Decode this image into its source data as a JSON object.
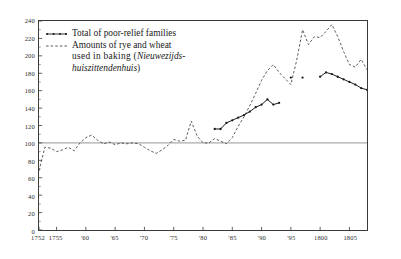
{
  "chart_data": {
    "type": "line",
    "title": "",
    "xlabel": "",
    "ylabel": "",
    "xlim": [
      1752,
      1808
    ],
    "ylim": [
      0,
      240
    ],
    "grid": false,
    "reference_line": 100,
    "legend_position": "top-left",
    "y_ticks": [
      0,
      20,
      40,
      60,
      80,
      100,
      120,
      140,
      160,
      180,
      200,
      220,
      240
    ],
    "y_tick_labels": [
      "0",
      "20",
      "40",
      "60",
      "80",
      "100",
      "120",
      "140",
      "160",
      "180",
      "200",
      "220",
      "240"
    ],
    "x_ticks": [
      1752,
      1755,
      1760,
      1765,
      1770,
      1775,
      1780,
      1785,
      1790,
      1795,
      1800,
      1805
    ],
    "x_tick_labels": [
      "1752",
      "1755",
      "'60",
      "'65",
      "'70",
      "'75",
      "'80",
      "'85",
      "'90",
      "'95",
      "1800",
      "1805"
    ],
    "series": [
      {
        "name": "Total of poor-relief families",
        "style": "solid-with-markers",
        "color": "#1a1a1a",
        "x": [
          1782,
          1783,
          1784,
          1785,
          1786,
          1787,
          1788,
          1789,
          1790,
          1791,
          1792,
          1793,
          1795,
          1797,
          1800,
          1801,
          1802,
          1803,
          1804,
          1805,
          1806,
          1807,
          1808
        ],
        "y": [
          116,
          116,
          123,
          126,
          129,
          132,
          136,
          141,
          144,
          150,
          144,
          146,
          175,
          175,
          176,
          181,
          179,
          176,
          173,
          170,
          167,
          163,
          161
        ],
        "segments": [
          {
            "x": [
              1782,
              1783,
              1784,
              1785,
              1786,
              1787,
              1788,
              1789,
              1790,
              1791,
              1792,
              1793
            ],
            "y": [
              116,
              116,
              123,
              126,
              129,
              132,
              136,
              141,
              144,
              150,
              144,
              146
            ]
          },
          {
            "x": [
              1800,
              1801,
              1802,
              1803,
              1804,
              1805,
              1806,
              1807,
              1808
            ],
            "y": [
              176,
              181,
              179,
              176,
              173,
              170,
              167,
              163,
              161
            ]
          }
        ],
        "isolated_points": [
          {
            "x": 1795,
            "y": 175
          },
          {
            "x": 1797,
            "y": 175
          }
        ]
      },
      {
        "name": "Amounts of rye and wheat used in baking (Nieuwezijdshuiszittendenhuis)",
        "style": "dashed",
        "color": "#4a4a4a",
        "x": [
          1752,
          1753,
          1754,
          1755,
          1756,
          1757,
          1758,
          1759,
          1760,
          1761,
          1762,
          1763,
          1764,
          1765,
          1766,
          1767,
          1768,
          1769,
          1770,
          1771,
          1772,
          1773,
          1774,
          1775,
          1776,
          1777,
          1778,
          1779,
          1780,
          1781,
          1782,
          1783,
          1784,
          1785,
          1786,
          1787,
          1788,
          1789,
          1790,
          1791,
          1792,
          1793,
          1794,
          1795,
          1796,
          1797,
          1798,
          1799,
          1800,
          1801,
          1802,
          1803,
          1804,
          1805,
          1806,
          1807,
          1808
        ],
        "y": [
          68,
          95,
          94,
          90,
          92,
          95,
          91,
          100,
          106,
          109,
          103,
          99,
          101,
          98,
          100,
          99,
          100,
          99,
          95,
          91,
          88,
          92,
          97,
          104,
          102,
          103,
          125,
          108,
          100,
          100,
          105,
          102,
          99,
          106,
          119,
          130,
          143,
          157,
          172,
          183,
          190,
          181,
          174,
          167,
          195,
          230,
          213,
          222,
          221,
          228,
          236,
          222,
          205,
          190,
          187,
          196,
          184
        ]
      }
    ]
  },
  "legend": {
    "items": [
      {
        "key": "solid-marker-line",
        "line1": "Total of poor-relief families",
        "line2": "",
        "line3": ""
      },
      {
        "key": "dashed-line",
        "line1": "Amounts of rye and wheat",
        "line2_plain": "used    in   baking (",
        "line2_italic": "Nieuwezijds-",
        "line3_italic": "huiszittendenhuis",
        "line3_plain": ")"
      }
    ]
  }
}
